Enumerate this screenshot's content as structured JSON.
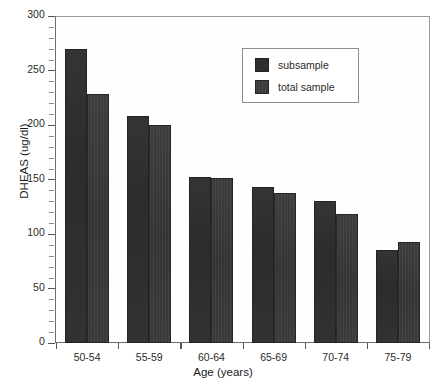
{
  "chart_data": {
    "type": "bar",
    "title": "",
    "xlabel": "Age (years)",
    "ylabel": "DHEAS (ug/dl)",
    "categories": [
      "50-54",
      "55-59",
      "60-64",
      "65-69",
      "70-74",
      "75-79"
    ],
    "series": [
      {
        "name": "subsample",
        "values": [
          270,
          208,
          152,
          143,
          130,
          85
        ]
      },
      {
        "name": "total sample",
        "values": [
          228,
          200,
          151,
          138,
          118,
          93
        ]
      }
    ],
    "ylim": [
      0,
      300
    ],
    "yticks": [
      0,
      50,
      100,
      150,
      200,
      250,
      300
    ],
    "ytick_labels": [
      "0",
      "50",
      "100",
      "150",
      "200",
      "250",
      "300"
    ],
    "y_minor_step": 10,
    "grid": false,
    "legend_position": "upper right",
    "legend_entries": [
      "subsample",
      "total sample"
    ],
    "colors": {
      "series_0": "#2f2f2f",
      "series_1": "#3a3a3a",
      "axis": "#555555",
      "frame": "#9a9a9a",
      "text": "#1a1a1a",
      "background": "#ffffff"
    }
  }
}
